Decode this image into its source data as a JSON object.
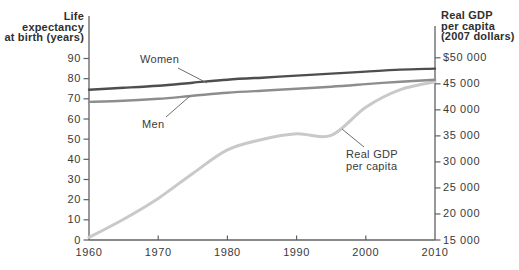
{
  "chart_data": {
    "type": "line",
    "x_years": [
      1960,
      1965,
      1970,
      1975,
      1980,
      1985,
      1990,
      1995,
      2000,
      2005,
      2010
    ],
    "x_axis": {
      "range": [
        1960,
        2010
      ],
      "ticks": [
        1960,
        1970,
        1980,
        1990,
        2000,
        2010
      ],
      "tick_marks": [
        1970,
        1980,
        1990,
        2000
      ]
    },
    "left_axis": {
      "title_lines": [
        "Life",
        "expectancy",
        "at birth (years)"
      ],
      "range": [
        0,
        90
      ],
      "ticks": [
        0,
        10,
        20,
        30,
        40,
        50,
        60,
        70,
        80,
        90
      ]
    },
    "right_axis": {
      "title_lines": [
        "Real GDP",
        "per capita",
        "(2007 dollars)"
      ],
      "range": [
        15000,
        50000
      ],
      "ticks": [
        {
          "value": 50000,
          "label": "$50 000"
        },
        {
          "value": 45000,
          "label": "45 000"
        },
        {
          "value": 40000,
          "label": "40 000"
        },
        {
          "value": 35000,
          "label": "35 000"
        },
        {
          "value": 30000,
          "label": "30 000"
        },
        {
          "value": 25000,
          "label": "25 000"
        },
        {
          "value": 20000,
          "label": "20 000"
        },
        {
          "value": 15000,
          "label": "15 000"
        }
      ]
    },
    "series": [
      {
        "name": "Women",
        "axis": "left",
        "color": "#4e4e4e",
        "width": 2.4,
        "values": [
          74.5,
          75.5,
          76.5,
          78,
          79.5,
          80.5,
          81.5,
          82.5,
          83.5,
          84.5,
          85
        ]
      },
      {
        "name": "Men",
        "axis": "left",
        "color": "#8d8d8d",
        "width": 2.4,
        "values": [
          68.5,
          69,
          70,
          71.5,
          73,
          74,
          75,
          76,
          77.3,
          78.5,
          79.5
        ]
      },
      {
        "name": "Real GDP per capita",
        "axis": "right",
        "color": "#c9c9c9",
        "width": 3,
        "values": [
          15500,
          19000,
          23000,
          27800,
          32300,
          34300,
          35400,
          35100,
          40500,
          43900,
          45400
        ]
      }
    ],
    "annotations": [
      {
        "id": "women",
        "lines": [
          "Women"
        ],
        "pos": [
          140,
          54
        ],
        "leader": [
          [
            178,
            68
          ],
          [
            207,
            83
          ]
        ]
      },
      {
        "id": "men",
        "lines": [
          "Men"
        ],
        "pos": [
          142,
          119
        ],
        "leader": [
          [
            166,
            117
          ],
          [
            190,
            96
          ]
        ]
      },
      {
        "id": "gdp",
        "lines": [
          "Real GDP",
          "per capita"
        ],
        "pos": [
          346,
          149
        ],
        "leader": [
          [
            364,
            147
          ],
          [
            342,
            129
          ]
        ]
      }
    ],
    "grid": false,
    "legend_position": "inline-annotations"
  },
  "colors": {
    "background": "#ffffff",
    "axis": "#606060",
    "leader_line": "#6f6f6f",
    "tick_text": "#3a3a3a",
    "title_text": "#2f2f2f",
    "women_line": "#4e4e4e",
    "men_line": "#8d8d8d",
    "gdp_line": "#c9c9c9"
  }
}
